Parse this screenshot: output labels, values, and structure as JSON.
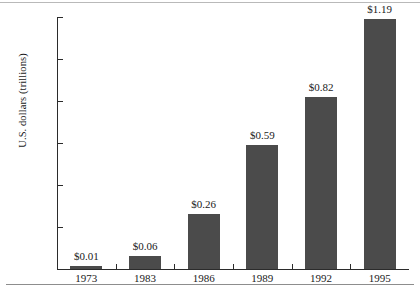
{
  "chart_data": {
    "type": "bar",
    "title": "",
    "xlabel": "",
    "ylabel": "U.S. dollars (trillions)",
    "categories": [
      "1973",
      "1983",
      "1986",
      "1989",
      "1992",
      "1995"
    ],
    "values": [
      0.01,
      0.06,
      0.26,
      0.59,
      0.82,
      1.19
    ],
    "data_labels": [
      "$0.01",
      "$0.06",
      "$0.26",
      "$0.59",
      "$0.82",
      "$1.19"
    ],
    "ylim": [
      0,
      1.2
    ],
    "ytick_values": [
      0.2,
      0.4,
      0.6,
      0.8,
      1.0,
      1.2
    ],
    "ytick_labels": [
      "0.20",
      "0.40",
      "0.60",
      "0.80",
      "1.00",
      "1.20"
    ],
    "grid": false,
    "legend": null,
    "series": [
      {
        "name": "U.S. dollars (trillions)",
        "values": [
          0.01,
          0.06,
          0.26,
          0.59,
          0.82,
          1.19
        ]
      }
    ],
    "bar_color": "#4b4b4b",
    "axis_color": "#2b2b2b"
  }
}
